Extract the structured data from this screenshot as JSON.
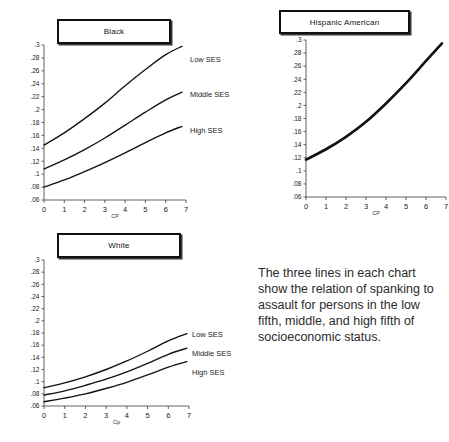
{
  "figure": {
    "caption": "The three lines in each chart show the relation of spanking to assault for persons in the low fifth, middle, and high fifth of socioeconomic status."
  },
  "charts": {
    "black": {
      "title": "Black",
      "xlabel": "CP",
      "legend": {
        "low": "Low SES",
        "middle": "Middle SES",
        "high": "High SES"
      },
      "xticks": [
        "0",
        "1",
        "2",
        "3",
        "4",
        "5",
        "6",
        "7"
      ],
      "yticks": [
        ".3",
        ".28",
        ".26",
        ".24",
        ".22",
        ".2",
        ".18",
        ".16",
        ".14",
        ".12",
        ".1",
        ".08",
        ".06"
      ]
    },
    "hispanic": {
      "title": "Hispanic American",
      "xlabel": "CP",
      "xticks": [
        "0",
        "1",
        "2",
        "3",
        "4",
        "5",
        "6",
        "7"
      ],
      "yticks": [
        ".3",
        ".28",
        ".26",
        ".24",
        ".22",
        ".2",
        ".18",
        ".16",
        ".14",
        ".12",
        ".1",
        ".08",
        ".06"
      ]
    },
    "white": {
      "title": "White",
      "xlabel": "Cp",
      "legend": {
        "low": "Low SES",
        "middle": "Middle SES",
        "high": "High SES"
      },
      "xticks": [
        "0",
        "1",
        "2",
        "3",
        "4",
        "5",
        "6",
        "7"
      ],
      "yticks": [
        ".3",
        ".28",
        ".26",
        ".24",
        ".22",
        ".2",
        ".18",
        ".16",
        ".14",
        ".12",
        ".1",
        ".08",
        ".06"
      ]
    }
  },
  "chart_data": [
    {
      "type": "line",
      "title": "Black",
      "xlabel": "CP",
      "ylabel": "",
      "xlim": [
        0,
        7
      ],
      "ylim": [
        0.06,
        0.3
      ],
      "grid": false,
      "legend_position": "right-inline",
      "x": [
        0,
        1,
        2,
        3,
        4,
        5,
        6,
        6.8
      ],
      "series": [
        {
          "name": "Low SES",
          "values": [
            0.145,
            0.164,
            0.186,
            0.21,
            0.237,
            0.262,
            0.285,
            0.298
          ]
        },
        {
          "name": "Middle SES",
          "values": [
            0.108,
            0.122,
            0.138,
            0.156,
            0.176,
            0.196,
            0.215,
            0.227
          ]
        },
        {
          "name": "High SES",
          "values": [
            0.08,
            0.091,
            0.104,
            0.118,
            0.133,
            0.149,
            0.164,
            0.174
          ]
        }
      ]
    },
    {
      "type": "line",
      "title": "Hispanic American",
      "xlabel": "CP",
      "ylabel": "",
      "xlim": [
        0,
        7
      ],
      "ylim": [
        0.06,
        0.3
      ],
      "grid": false,
      "legend_position": "none",
      "x": [
        0,
        1,
        2,
        3,
        4,
        5,
        6,
        6.8
      ],
      "series": [
        {
          "name": "Low SES",
          "values": [
            0.117,
            0.133,
            0.152,
            0.175,
            0.203,
            0.234,
            0.268,
            0.295
          ]
        },
        {
          "name": "Middle SES",
          "values": [
            0.117,
            0.133,
            0.152,
            0.175,
            0.203,
            0.234,
            0.268,
            0.295
          ]
        },
        {
          "name": "High SES",
          "values": [
            0.117,
            0.133,
            0.152,
            0.175,
            0.203,
            0.234,
            0.268,
            0.295
          ]
        }
      ]
    },
    {
      "type": "line",
      "title": "White",
      "xlabel": "Cp",
      "ylabel": "",
      "xlim": [
        0,
        7
      ],
      "ylim": [
        0.06,
        0.3
      ],
      "grid": false,
      "legend_position": "right-inline",
      "x": [
        0,
        1,
        2,
        3,
        4,
        5,
        6,
        6.9
      ],
      "series": [
        {
          "name": "Low SES",
          "values": [
            0.09,
            0.098,
            0.108,
            0.12,
            0.134,
            0.15,
            0.167,
            0.179
          ]
        },
        {
          "name": "Middle SES",
          "values": [
            0.078,
            0.085,
            0.094,
            0.104,
            0.116,
            0.13,
            0.145,
            0.155
          ]
        },
        {
          "name": "High SES",
          "values": [
            0.067,
            0.073,
            0.08,
            0.089,
            0.099,
            0.111,
            0.124,
            0.133
          ]
        }
      ]
    }
  ]
}
